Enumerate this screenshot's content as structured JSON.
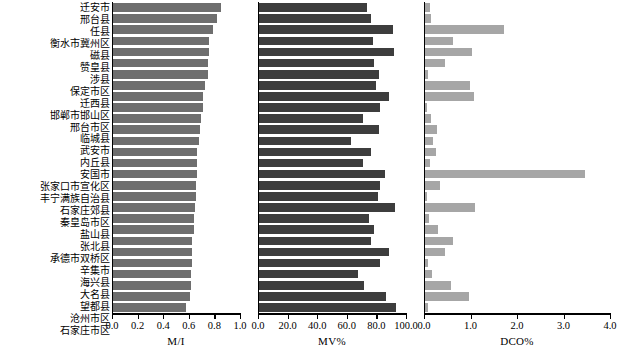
{
  "figure": {
    "width": 620,
    "height": 350,
    "background": "#ffffff"
  },
  "categories": [
    "迁安市",
    "邢台县",
    "任县",
    "衡水市冀州区",
    "磁县",
    "赞皇县",
    "涉县",
    "保定市区",
    "迁西县",
    "邯郸市邯山区",
    "邢台市区",
    "临城县",
    "武安市",
    "内丘县",
    "安国市",
    "张家口市宣化区",
    "丰宁满族自治县",
    "石家庄郊县",
    "秦皇岛市区",
    "盐山县",
    "张北县",
    "承德市双桥区",
    "辛集市",
    "海兴县",
    "大名县",
    "望都县",
    "沧州市区",
    "石家庄市区"
  ],
  "chart_data": [
    {
      "type": "bar",
      "orientation": "horizontal",
      "title": "",
      "xlabel": "M/I",
      "ylabel": "",
      "xlim": [
        0.0,
        1.0
      ],
      "xticks": [
        0.0,
        0.2,
        0.4,
        0.6,
        0.8,
        1.0
      ],
      "xticklabels": [
        "0.0",
        "0.2",
        "0.4",
        "0.6",
        "0.8",
        "1.0"
      ],
      "grid": false,
      "bar_color": "#6e6e6e",
      "categories": [
        "迁安市",
        "邢台县",
        "任县",
        "衡水市冀州区",
        "磁县",
        "赞皇县",
        "涉县",
        "保定市区",
        "迁西县",
        "邯郸市邯山区",
        "邢台市区",
        "临城县",
        "武安市",
        "内丘县",
        "安国市",
        "张家口市宣化区",
        "丰宁满族自治县",
        "石家庄郊县",
        "秦皇岛市区",
        "盐山县",
        "张北县",
        "承德市双桥区",
        "辛集市",
        "海兴县",
        "大名县",
        "望都县",
        "沧州市区",
        "石家庄市区"
      ],
      "values": [
        0.84,
        0.81,
        0.78,
        0.75,
        0.75,
        0.74,
        0.74,
        0.72,
        0.7,
        0.7,
        0.69,
        0.68,
        0.67,
        0.66,
        0.66,
        0.66,
        0.65,
        0.65,
        0.64,
        0.63,
        0.63,
        0.62,
        0.62,
        0.62,
        0.61,
        0.61,
        0.6,
        0.57
      ]
    },
    {
      "type": "bar",
      "orientation": "horizontal",
      "title": "",
      "xlabel": "MV%",
      "ylabel": "",
      "xlim": [
        0.0,
        100.0
      ],
      "xticks": [
        0.0,
        20.0,
        40.0,
        60.0,
        80.0,
        100.0
      ],
      "xticklabels": [
        "0.0",
        "20.0",
        "40.0",
        "60.0",
        "80.0",
        "100.0"
      ],
      "grid": false,
      "bar_color": "#3d3d3d",
      "categories": [
        "迁安市",
        "邢台县",
        "任县",
        "衡水市冀州区",
        "磁县",
        "赞皇县",
        "涉县",
        "保定市区",
        "迁西县",
        "邯郸市邯山区",
        "邢台市区",
        "临城县",
        "武安市",
        "内丘县",
        "安国市",
        "张家口市宣化区",
        "丰宁满族自治县",
        "石家庄郊县",
        "秦皇岛市区",
        "盐山县",
        "张北县",
        "承德市双桥区",
        "辛集市",
        "海兴县",
        "大名县",
        "望都县",
        "沧州市区",
        "石家庄市区"
      ],
      "values": [
        73.0,
        76.0,
        90.5,
        77.0,
        91.0,
        77.5,
        81.0,
        79.0,
        88.0,
        82.0,
        70.5,
        81.0,
        62.0,
        75.5,
        70.0,
        85.0,
        82.0,
        80.5,
        92.0,
        74.0,
        78.0,
        76.0,
        87.5,
        82.0,
        67.0,
        71.0,
        85.5,
        92.5
      ]
    },
    {
      "type": "bar",
      "orientation": "horizontal",
      "title": "",
      "xlabel": "DCO%",
      "ylabel": "",
      "xlim": [
        0.0,
        4.0
      ],
      "xticks": [
        0.0,
        1.0,
        2.0,
        3.0,
        4.0
      ],
      "xticklabels": [
        "0.0",
        "1.0",
        "2.0",
        "3.0",
        "4.0"
      ],
      "grid": false,
      "bar_color": "#a6a6a6",
      "categories": [
        "迁安市",
        "邢台县",
        "任县",
        "衡水市冀州区",
        "磁县",
        "赞皇县",
        "涉县",
        "保定市区",
        "迁西县",
        "邯郸市邯山区",
        "邢台市区",
        "临城县",
        "武安市",
        "内丘县",
        "安国市",
        "张家口市宣化区",
        "丰宁满族自治县",
        "石家庄郊县",
        "秦皇岛市区",
        "盐山县",
        "张北县",
        "承德市双桥区",
        "辛集市",
        "海兴县",
        "大名县",
        "望都县",
        "沧州市区",
        "石家庄市区"
      ],
      "values": [
        0.11,
        0.12,
        1.7,
        0.6,
        1.0,
        0.42,
        0.06,
        0.97,
        1.05,
        0.04,
        0.12,
        0.25,
        0.17,
        0.23,
        0.11,
        3.45,
        0.33,
        0.05,
        1.07,
        0.09,
        0.27,
        0.6,
        0.42,
        0.07,
        0.15,
        0.55,
        0.95,
        0.06
      ]
    }
  ],
  "panels": [
    {
      "name": "m-over-i",
      "axis_title": "M/I"
    },
    {
      "name": "mv-percent",
      "axis_title": "MV%"
    },
    {
      "name": "dco-percent",
      "axis_title": "DCO%"
    }
  ]
}
